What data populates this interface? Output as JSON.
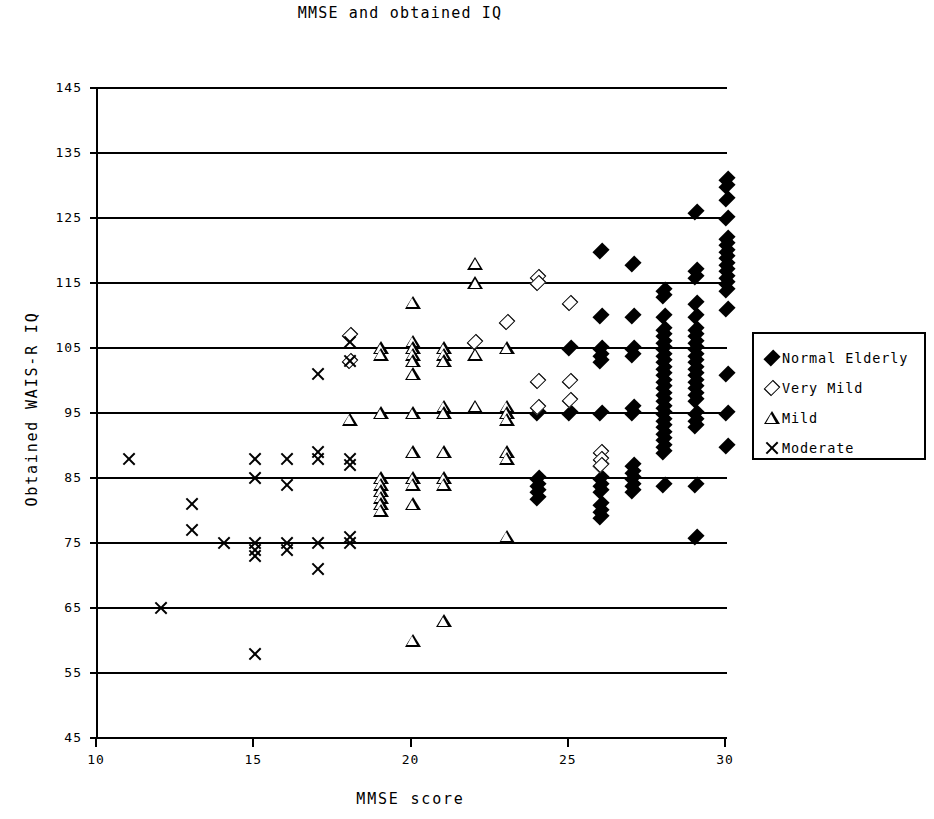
{
  "chart_data": {
    "type": "scatter",
    "title": "MMSE and obtained IQ",
    "xlabel": "MMSE score",
    "ylabel": "Obtained WAIS-R IQ",
    "xlim": [
      10,
      30
    ],
    "ylim": [
      45,
      145
    ],
    "xticks": [
      10,
      15,
      20,
      25,
      30
    ],
    "yticks": [
      45,
      55,
      65,
      75,
      85,
      95,
      105,
      115,
      125,
      135,
      145
    ],
    "grid": "horizontal",
    "legend_position": "right",
    "series": [
      {
        "name": "Normal Elderly",
        "marker": "filled-diamond",
        "color": "#000000",
        "points": [
          [
            24,
            95
          ],
          [
            24,
            85
          ],
          [
            24,
            84
          ],
          [
            24,
            83
          ],
          [
            24,
            82
          ],
          [
            25,
            105
          ],
          [
            25,
            95
          ],
          [
            26,
            120
          ],
          [
            26,
            110
          ],
          [
            26,
            105
          ],
          [
            26,
            104
          ],
          [
            26,
            103
          ],
          [
            26,
            95
          ],
          [
            26,
            87
          ],
          [
            26,
            85
          ],
          [
            26,
            84
          ],
          [
            26,
            83
          ],
          [
            26,
            81
          ],
          [
            26,
            80
          ],
          [
            26,
            79
          ],
          [
            27,
            118
          ],
          [
            27,
            110
          ],
          [
            27,
            105
          ],
          [
            27,
            104
          ],
          [
            27,
            96
          ],
          [
            27,
            95
          ],
          [
            27,
            87
          ],
          [
            27,
            86
          ],
          [
            27,
            85
          ],
          [
            27,
            84
          ],
          [
            27,
            83
          ],
          [
            28,
            114
          ],
          [
            28,
            113
          ],
          [
            28,
            110
          ],
          [
            28,
            108
          ],
          [
            28,
            107
          ],
          [
            28,
            106
          ],
          [
            28,
            105
          ],
          [
            28,
            104
          ],
          [
            28,
            103
          ],
          [
            28,
            102
          ],
          [
            28,
            101
          ],
          [
            28,
            100
          ],
          [
            28,
            99
          ],
          [
            28,
            98
          ],
          [
            28,
            97
          ],
          [
            28,
            96
          ],
          [
            28,
            95
          ],
          [
            28,
            94
          ],
          [
            28,
            93
          ],
          [
            28,
            92
          ],
          [
            28,
            91
          ],
          [
            28,
            90
          ],
          [
            28,
            89
          ],
          [
            28,
            84
          ],
          [
            29,
            126
          ],
          [
            29,
            117
          ],
          [
            29,
            116
          ],
          [
            29,
            112
          ],
          [
            29,
            110
          ],
          [
            29,
            108
          ],
          [
            29,
            107
          ],
          [
            29,
            106
          ],
          [
            29,
            105
          ],
          [
            29,
            104
          ],
          [
            29,
            103
          ],
          [
            29,
            102
          ],
          [
            29,
            101
          ],
          [
            29,
            100
          ],
          [
            29,
            99
          ],
          [
            29,
            98
          ],
          [
            29,
            97
          ],
          [
            29,
            95
          ],
          [
            29,
            94
          ],
          [
            29,
            93
          ],
          [
            29,
            84
          ],
          [
            29,
            76
          ],
          [
            30,
            131
          ],
          [
            30,
            130
          ],
          [
            30,
            128
          ],
          [
            30,
            125
          ],
          [
            30,
            122
          ],
          [
            30,
            121
          ],
          [
            30,
            120
          ],
          [
            30,
            119
          ],
          [
            30,
            118
          ],
          [
            30,
            117
          ],
          [
            30,
            116
          ],
          [
            30,
            115
          ],
          [
            30,
            114
          ],
          [
            30,
            111
          ],
          [
            30,
            101
          ],
          [
            30,
            95
          ],
          [
            30,
            90
          ]
        ]
      },
      {
        "name": "Very Mild",
        "marker": "open-diamond",
        "color": "#000000",
        "points": [
          [
            18,
            107
          ],
          [
            18,
            103
          ],
          [
            22,
            106
          ],
          [
            23,
            109
          ],
          [
            24,
            116
          ],
          [
            24,
            115
          ],
          [
            24,
            100
          ],
          [
            24,
            96
          ],
          [
            25,
            112
          ],
          [
            25,
            100
          ],
          [
            25,
            97
          ],
          [
            26,
            89
          ],
          [
            26,
            88
          ],
          [
            26,
            87
          ]
        ]
      },
      {
        "name": "Mild",
        "marker": "open-triangle",
        "color": "#000000",
        "points": [
          [
            18,
            94
          ],
          [
            19,
            105
          ],
          [
            19,
            104
          ],
          [
            19,
            95
          ],
          [
            19,
            85
          ],
          [
            19,
            84
          ],
          [
            19,
            83
          ],
          [
            19,
            82
          ],
          [
            19,
            81
          ],
          [
            19,
            80
          ],
          [
            20,
            112
          ],
          [
            20,
            106
          ],
          [
            20,
            105
          ],
          [
            20,
            104
          ],
          [
            20,
            103
          ],
          [
            20,
            101
          ],
          [
            20,
            95
          ],
          [
            20,
            89
          ],
          [
            20,
            85
          ],
          [
            20,
            84
          ],
          [
            20,
            81
          ],
          [
            20,
            60
          ],
          [
            21,
            105
          ],
          [
            21,
            104
          ],
          [
            21,
            103
          ],
          [
            21,
            96
          ],
          [
            21,
            95
          ],
          [
            21,
            89
          ],
          [
            21,
            85
          ],
          [
            21,
            84
          ],
          [
            21,
            63
          ],
          [
            22,
            118
          ],
          [
            22,
            115
          ],
          [
            22,
            104
          ],
          [
            22,
            96
          ],
          [
            23,
            105
          ],
          [
            23,
            96
          ],
          [
            23,
            95
          ],
          [
            23,
            94
          ],
          [
            23,
            89
          ],
          [
            23,
            88
          ],
          [
            23,
            76
          ]
        ]
      },
      {
        "name": "Moderate",
        "marker": "x",
        "color": "#000000",
        "points": [
          [
            11,
            88
          ],
          [
            12,
            65
          ],
          [
            13,
            81
          ],
          [
            13,
            77
          ],
          [
            14,
            75
          ],
          [
            15,
            88
          ],
          [
            15,
            85
          ],
          [
            15,
            75
          ],
          [
            15,
            74
          ],
          [
            15,
            73
          ],
          [
            15,
            58
          ],
          [
            16,
            88
          ],
          [
            16,
            84
          ],
          [
            16,
            75
          ],
          [
            16,
            74
          ],
          [
            17,
            101
          ],
          [
            17,
            89
          ],
          [
            17,
            88
          ],
          [
            17,
            75
          ],
          [
            17,
            71
          ],
          [
            18,
            106
          ],
          [
            18,
            103
          ],
          [
            18,
            88
          ],
          [
            18,
            87
          ],
          [
            18,
            76
          ],
          [
            18,
            75
          ]
        ]
      }
    ]
  },
  "axis": {
    "x_tick_labels": [
      "10",
      "15",
      "20",
      "25",
      "30"
    ],
    "y_tick_labels": [
      "145",
      "135",
      "125",
      "115",
      "105",
      "95",
      "85",
      "75",
      "65",
      "55",
      "45"
    ]
  },
  "legend": {
    "entries": [
      {
        "label": "Normal Elderly",
        "marker": "filled-diamond"
      },
      {
        "label": "Very Mild",
        "marker": "open-diamond"
      },
      {
        "label": "Mild",
        "marker": "open-triangle"
      },
      {
        "label": "Moderate",
        "marker": "x"
      }
    ]
  }
}
